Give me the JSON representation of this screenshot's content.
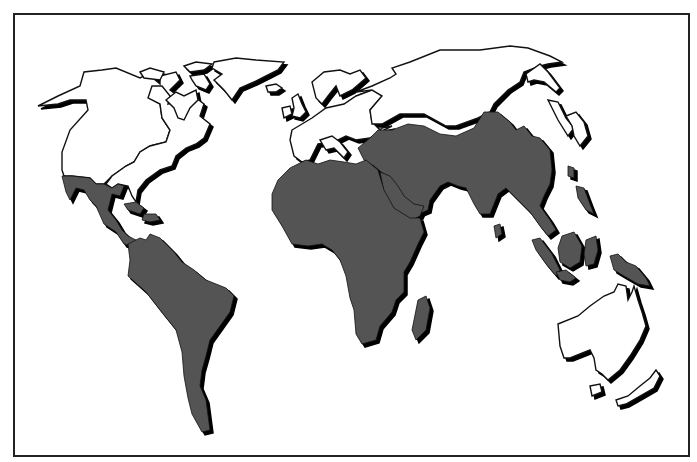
{
  "map": {
    "frame": {
      "x": 14,
      "y": 14,
      "width": 675,
      "height": 442,
      "stroke": "#222222",
      "stroke_width": 2
    },
    "colors": {
      "background": "#ffffff",
      "shaded_fill": "#545454",
      "unshaded_fill": "#ffffff",
      "outline": "#111111",
      "shadow": "#000000"
    },
    "shadow_offset": [
      3,
      3
    ],
    "regions": [
      {
        "name": "alaska-canada",
        "shaded": false,
        "points": "38,106 58,96 80,86 84,72 102,70 116,68 140,78 148,74 160,84 160,76 176,72 180,80 170,90 178,96 160,104 162,118 170,130 166,142 150,146 140,152 134,162 126,166 112,176 104,184 96,184 90,178 72,176 64,176 62,170 62,152 70,130 88,110 86,100 70,100 58,104"
      },
      {
        "name": "usa-east",
        "shaded": false,
        "points": "152,86 162,86 170,96 168,104 176,102 196,98 204,104 200,116 210,124 204,138 196,144 186,148 176,156 172,166 160,170 146,180 138,190 136,202 132,196 128,186 118,184 112,188 106,184 112,176 126,166 134,162 140,152 150,146 166,142 170,130 162,118 160,104 148,98"
      },
      {
        "name": "hudson-east",
        "shaded": false,
        "points": "166,100 176,92 184,96 196,90 198,100 190,108 184,120 178,118 174,108"
      },
      {
        "name": "arctic-island-1",
        "shaded": false,
        "points": "140,72 150,68 164,72 160,80 144,78"
      },
      {
        "name": "arctic-island-2",
        "shaded": false,
        "points": "184,66 196,62 212,64 204,70 190,72"
      },
      {
        "name": "baffin",
        "shaded": false,
        "points": "190,76 204,74 210,84 206,90 196,86 192,80"
      },
      {
        "name": "greenland",
        "shaded": false,
        "points": "214,62 236,58 256,60 284,62 278,70 266,76 254,82 240,88 232,100 224,90 214,80 222,74 212,68"
      },
      {
        "name": "iceland",
        "shaded": false,
        "points": "266,86 276,84 282,88 276,92 268,92"
      },
      {
        "name": "mexico-central-america",
        "shaded": true,
        "points": "62,176 72,176 90,178 96,184 104,184 112,188 118,184 124,186 120,196 112,194 108,210 116,220 122,230 128,236 140,242 132,246 124,244 116,232 104,224 96,206 90,200 84,190 76,188 70,200 66,192 64,184"
      },
      {
        "name": "cuba",
        "shaded": true,
        "points": "124,204 136,202 144,208 140,214 128,210"
      },
      {
        "name": "hispaniola",
        "shaded": true,
        "points": "144,214 156,214 160,220 150,222 142,220"
      },
      {
        "name": "south-america",
        "shaded": true,
        "points": "128,244 140,238 146,240 150,234 160,238 174,252 182,262 194,270 206,280 226,288 234,296 230,312 220,326 210,340 206,356 202,370 200,386 206,400 210,430 202,432 192,414 188,398 184,376 182,352 176,330 160,310 146,292 128,276 130,260"
      },
      {
        "name": "uk",
        "shaded": false,
        "points": "292,98 298,94 302,104 306,112 300,118 292,116 294,108"
      },
      {
        "name": "ireland",
        "shaded": false,
        "points": "282,108 290,106 292,114 284,118"
      },
      {
        "name": "scandinavia",
        "shaded": false,
        "points": "312,82 324,72 340,70 350,74 360,70 366,78 352,90 340,96 336,86 328,96 322,104 316,98"
      },
      {
        "name": "europe",
        "shaded": false,
        "points": "292,130 302,124 312,118 326,108 344,104 356,96 372,90 382,96 370,110 372,122 380,130 382,128 392,126 376,134 370,138 356,140 346,136 334,142 318,144 310,160 302,162 294,156 290,140"
      },
      {
        "name": "italy-balkans",
        "shaded": false,
        "points": "320,140 332,136 340,142 348,152 344,158 334,148 326,150"
      },
      {
        "name": "russia-north-asia",
        "shaded": false,
        "points": "356,92 372,86 390,78 396,74 392,68 410,62 440,50 480,50 510,46 528,48 550,56 562,62 548,64 540,66 524,72 520,82 508,90 494,104 490,112 478,118 456,126 446,126 424,114 400,114 382,124 372,124 370,110 382,96 372,90"
      },
      {
        "name": "kamchatka",
        "shaded": false,
        "points": "526,74 540,64 548,72 560,88 556,92 544,82 534,80 528,82"
      },
      {
        "name": "sakhalin-japan-1",
        "shaded": false,
        "points": "548,100 558,102 566,118 574,128 568,136 558,120"
      },
      {
        "name": "japan-2",
        "shaded": false,
        "points": "566,116 576,112 584,122 588,136 580,146 574,136 572,126"
      },
      {
        "name": "middle-east-south-asia",
        "shaded": true,
        "points": "370,138 378,130 392,130 408,124 424,126 440,134 456,136 474,128 484,112 498,112 510,122 516,130 524,126 532,136 540,138 550,150 552,170 550,184 544,196 540,206 550,220 556,230 548,236 540,226 530,212 522,204 514,196 506,188 498,194 490,214 480,214 474,204 466,188 458,186 448,182 440,186 430,200 428,210 414,216 404,208 398,196 396,186 386,176 374,166 364,160 358,148"
      },
      {
        "name": "arabia",
        "shaded": true,
        "points": "380,172 390,176 398,186 404,196 414,204 424,206 420,216 412,220 400,216 390,204 384,192"
      },
      {
        "name": "sri-lanka",
        "shaded": true,
        "points": "494,226 500,224 502,234 496,238"
      },
      {
        "name": "taiwan",
        "shaded": true,
        "points": "568,166 574,168 574,178 568,176"
      },
      {
        "name": "philippines",
        "shaded": true,
        "points": "576,186 584,188 590,204 594,214 586,210 578,198"
      },
      {
        "name": "sumatra",
        "shaded": true,
        "points": "532,240 540,238 552,254 560,270 556,276 546,264 536,250"
      },
      {
        "name": "borneo",
        "shaded": true,
        "points": "562,236 574,232 582,246 580,262 570,268 560,262 558,248"
      },
      {
        "name": "sulawesi",
        "shaded": true,
        "points": "586,240 596,236 598,250 594,264 586,266 584,254"
      },
      {
        "name": "java",
        "shaded": true,
        "points": "556,272 566,270 576,278 570,282 560,280"
      },
      {
        "name": "new-guinea",
        "shaded": true,
        "points": "610,256 618,254 626,262 636,266 646,278 650,286 638,284 624,276 614,270"
      },
      {
        "name": "africa",
        "shaded": true,
        "points": "278,180 290,168 306,160 318,164 330,160 344,162 356,164 366,160 378,170 384,190 394,208 410,218 420,218 424,232 418,244 410,262 404,272 404,292 396,300 392,312 380,326 376,340 362,344 356,334 354,310 350,298 346,276 340,260 332,250 322,244 308,246 292,244 282,226 272,210 272,194"
      },
      {
        "name": "madagascar",
        "shaded": true,
        "points": "418,300 426,296 430,308 426,330 416,340 412,330"
      },
      {
        "name": "australia",
        "shaded": false,
        "points": "558,324 578,316 590,306 604,296 614,292 618,284 626,286 628,300 632,292 634,286 638,300 642,312 646,326 640,340 630,356 620,370 608,380 602,374 596,370 594,358 590,350 580,354 570,358 564,358 560,346"
      },
      {
        "name": "tasmania",
        "shaded": false,
        "points": "590,386 600,384 602,392 592,396"
      },
      {
        "name": "new-zealand",
        "shaded": false,
        "points": "616,400 628,396 640,386 650,378 656,370 660,376 654,388 640,396 626,404 618,406"
      }
    ]
  }
}
